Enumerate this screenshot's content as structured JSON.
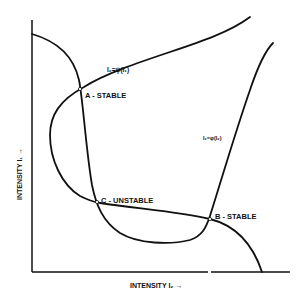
{
  "diagram": {
    "type": "bistability-intersection-curves",
    "axes": {
      "x_label": "INTENSITY I₂ →",
      "y_label": "INTENSITY I₁ →"
    },
    "curves": [
      {
        "id": "phi",
        "label": "I₁=φ(I₂)"
      },
      {
        "id": "psi",
        "label": "I₂=ψ(I₁)"
      }
    ],
    "points": [
      {
        "id": "A",
        "label": "A - STABLE"
      },
      {
        "id": "B",
        "label": "B - STABLE"
      },
      {
        "id": "C",
        "label": "C - UNSTABLE"
      }
    ],
    "colors": {
      "ink": "#111111",
      "background": "#ffffff"
    }
  }
}
